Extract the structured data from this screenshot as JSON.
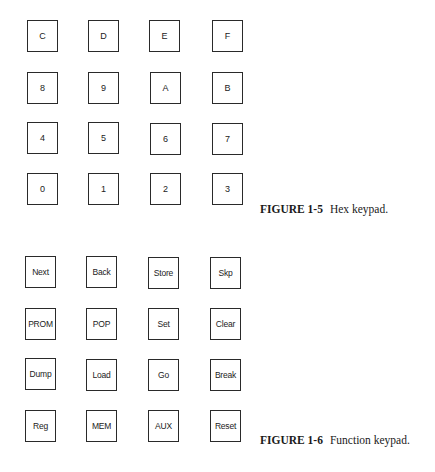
{
  "hex_keypad": {
    "rows": [
      [
        "C",
        "D",
        "E",
        "F"
      ],
      [
        "8",
        "9",
        "A",
        "B"
      ],
      [
        "4",
        "5",
        "6",
        "7"
      ],
      [
        "0",
        "1",
        "2",
        "3"
      ]
    ],
    "caption": {
      "figure_number": "FIGURE 1-5",
      "text": "Hex keypad."
    }
  },
  "function_keypad": {
    "rows": [
      [
        "Next",
        "Back",
        "Store",
        "Skp"
      ],
      [
        "PROM",
        "POP",
        "Set",
        "Clear"
      ],
      [
        "Dump",
        "Load",
        "Go",
        "Break"
      ],
      [
        "Reg",
        "MEM",
        "AUX",
        "Reset"
      ]
    ],
    "caption": {
      "figure_number": "FIGURE 1-6",
      "text": "Function keypad."
    }
  }
}
